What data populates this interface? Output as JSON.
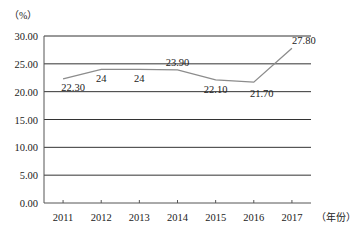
{
  "chart_data": {
    "type": "line",
    "title": "",
    "xlabel": "（年份）",
    "ylabel": "（%）",
    "categories": [
      "2011",
      "2012",
      "2013",
      "2014",
      "2015",
      "2016",
      "2017"
    ],
    "series": [
      {
        "name": "",
        "values": [
          22.3,
          24,
          24,
          23.9,
          22.1,
          21.7,
          27.8
        ],
        "labels": [
          "22.30",
          "24",
          "24",
          "23.90",
          "22.10",
          "21.70",
          "27.80"
        ]
      }
    ],
    "ylim": [
      0,
      30
    ],
    "yticks": [
      "0.00",
      "5.00",
      "10.00",
      "15.00",
      "20.00",
      "25.00",
      "30.00"
    ],
    "grid": true,
    "legend": "none"
  },
  "axis": {
    "y_unit": "（%）",
    "x_unit": "（年份）"
  },
  "colors": {
    "line": "#8c8c8c",
    "grid": "#333333",
    "axis": "#555555"
  }
}
